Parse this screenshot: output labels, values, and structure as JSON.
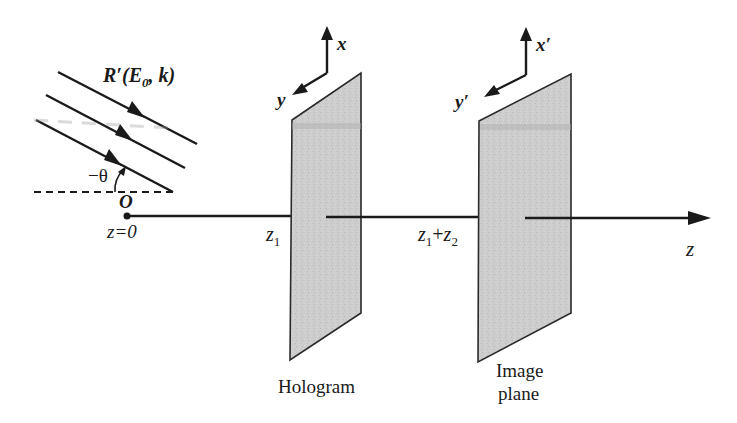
{
  "diagram": {
    "wave": {
      "label_R": "R",
      "label_prime": "′",
      "label_args_open": "(",
      "label_E": "E",
      "label_E_sub": "0",
      "label_comma": ", ",
      "label_k": "k",
      "label_args_close": ")",
      "num_rays": 3
    },
    "angle": {
      "label": "−θ"
    },
    "origin": {
      "label": "O",
      "z_label": "z=0"
    },
    "hologram": {
      "label": "Hologram",
      "position_label": "z",
      "position_sub": "1",
      "axis_x": "x",
      "axis_y": "y"
    },
    "image_plane": {
      "label_line1": "Image",
      "label_line2": "plane",
      "position_label_a": "z",
      "position_sub_a": "1",
      "position_plus": "+",
      "position_label_b": "z",
      "position_sub_b": "2",
      "axis_x": "x′",
      "axis_y": "y′"
    },
    "z_axis": {
      "label": "z"
    },
    "colors": {
      "ink": "#1a1a1a",
      "plate_fill": "#cfcfcf",
      "background": "#ffffff"
    }
  }
}
